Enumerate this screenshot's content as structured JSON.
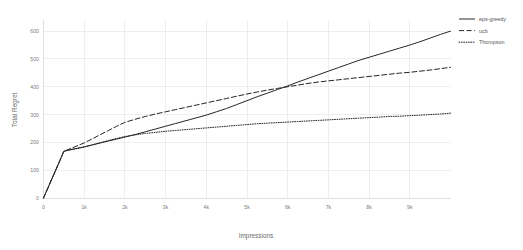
{
  "chart_data": {
    "type": "line",
    "title": "",
    "xlabel": "Impressions",
    "ylabel": "Total Regret",
    "xlim": [
      0,
      10000
    ],
    "ylim": [
      0,
      640
    ],
    "grid": true,
    "legend_position": "right",
    "xticks": [
      0,
      1000,
      2000,
      3000,
      4000,
      5000,
      6000,
      7000,
      8000,
      9000
    ],
    "xticklabels": [
      "0",
      "1k",
      "2k",
      "3k",
      "4k",
      "5k",
      "6k",
      "7k",
      "8k",
      "9k"
    ],
    "yticks": [
      0,
      100,
      200,
      300,
      400,
      500,
      600
    ],
    "yticklabels": [
      "0",
      "100",
      "200",
      "300",
      "400",
      "500",
      "600"
    ],
    "x": [
      0,
      100,
      200,
      300,
      400,
      500,
      600,
      700,
      800,
      900,
      1000,
      1200,
      1400,
      1600,
      1800,
      2000,
      2250,
      2500,
      2750,
      3000,
      3250,
      3500,
      3750,
      4000,
      4250,
      4500,
      4750,
      5000,
      5250,
      5500,
      5750,
      6000,
      6250,
      6500,
      6750,
      7000,
      7250,
      7500,
      7750,
      8000,
      8250,
      8500,
      8750,
      9000,
      9250,
      9500,
      9750,
      10000
    ],
    "series": [
      {
        "name": "eps-greedy",
        "style": "solid",
        "color": "#262626",
        "values": [
          0,
          33,
          67,
          100,
          134,
          168,
          172,
          175,
          178,
          181,
          184,
          191,
          198,
          205,
          212,
          219,
          228,
          238,
          248,
          258,
          268,
          278,
          288,
          298,
          310,
          322,
          336,
          350,
          364,
          377,
          390,
          403,
          417,
          430,
          443,
          456,
          469,
          482,
          495,
          506,
          517,
          528,
          539,
          550,
          562,
          575,
          588,
          600
        ]
      },
      {
        "name": "ucb",
        "style": "dashed",
        "color": "#262626",
        "values": [
          0,
          33,
          67,
          100,
          134,
          168,
          174,
          180,
          186,
          192,
          198,
          213,
          228,
          243,
          258,
          272,
          283,
          293,
          302,
          310,
          318,
          326,
          334,
          342,
          350,
          358,
          366,
          374,
          381,
          388,
          394,
          400,
          406,
          412,
          417,
          421,
          425,
          429,
          433,
          437,
          441,
          445,
          449,
          452,
          456,
          460,
          465,
          470
        ]
      },
      {
        "name": "Thompson",
        "style": "dotted",
        "color": "#262626",
        "values": [
          0,
          33,
          67,
          100,
          134,
          168,
          171,
          174,
          177,
          180,
          183,
          191,
          199,
          207,
          214,
          221,
          227,
          232,
          236,
          240,
          243,
          246,
          249,
          252,
          255,
          258,
          261,
          264,
          267,
          269,
          271,
          273,
          275,
          277,
          279,
          281,
          283,
          285,
          287,
          289,
          291,
          293,
          294,
          296,
          298,
          300,
          302,
          305
        ]
      }
    ]
  },
  "legend": {
    "items": [
      {
        "label": "eps-greedy",
        "dash": "none"
      },
      {
        "label": "ucb",
        "dash": "dashed"
      },
      {
        "label": "Thompson",
        "dash": "dotted"
      }
    ]
  },
  "axes": {
    "x_title": "Impressions",
    "y_title": "Total Regret"
  },
  "colors": {
    "line": "#262626",
    "grid": "#e3e3e3",
    "axis": "#d2d2d2",
    "tick_text": "#7d7d7d",
    "background": "#ffffff"
  }
}
